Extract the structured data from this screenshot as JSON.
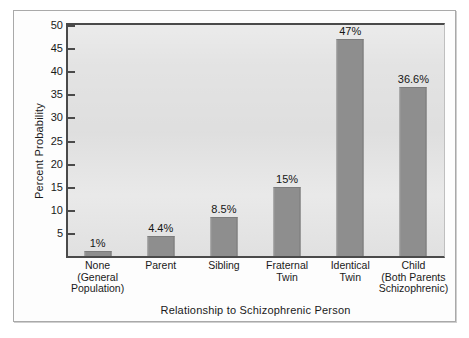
{
  "chart_data": {
    "type": "bar",
    "title": "",
    "xlabel": "Relationship to Schizophrenic Person",
    "ylabel": "Percent Probability",
    "categories": [
      "None (General Population)",
      "Parent",
      "Sibling",
      "Fraternal Twin",
      "Identical Twin",
      "Child (Both Parents Schizophrenic)"
    ],
    "category_lines": [
      [
        "None",
        "(General",
        "Population)"
      ],
      [
        "Parent"
      ],
      [
        "Sibling"
      ],
      [
        "Fraternal",
        "Twin"
      ],
      [
        "Identical",
        "Twin"
      ],
      [
        "Child",
        "(Both Parents",
        "Schizophrenic)"
      ]
    ],
    "values": [
      1,
      4.4,
      8.5,
      15,
      47,
      36.6
    ],
    "value_labels": [
      "1%",
      "4.4%",
      "8.5%",
      "15%",
      "47%",
      "36.6%"
    ],
    "ylim": [
      0,
      50
    ],
    "ytick_values": [
      5,
      10,
      15,
      20,
      25,
      30,
      35,
      40,
      45,
      50
    ],
    "ytick_labels": [
      "5",
      "10",
      "15",
      "20",
      "25",
      "30",
      "35",
      "40",
      "45",
      "50"
    ],
    "grid": false,
    "legend": "none",
    "colors": {
      "bar": "#8e8e8e",
      "plot_background": "#e3e3e3",
      "axis": "#4a4a4a",
      "text": "#1a1a1a",
      "figure_background": "#fdfdfd",
      "frame_border": "#a9a9a9"
    }
  }
}
